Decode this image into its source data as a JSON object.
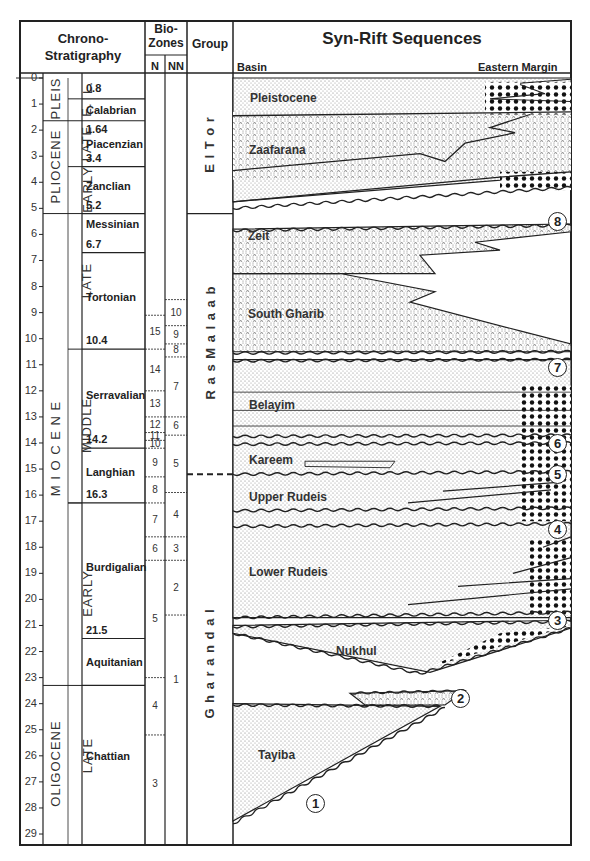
{
  "header": {
    "chrono_title_line1": "Chrono-",
    "chrono_title_line2": "Stratigraphy",
    "biozones_line1": "Bio-",
    "biozones_line2": "Zones",
    "biozone_n": "N",
    "biozone_nn": "NN",
    "group": "Group",
    "sequences_title": "Syn-Rift Sequences",
    "basin": "Basin",
    "eastern_margin": "Eastern Margin"
  },
  "axis": {
    "unit": "Ma",
    "min": 0,
    "max": 29,
    "ticks": [
      "0",
      "1",
      "2",
      "3",
      "4",
      "5",
      "6",
      "7",
      "8",
      "9",
      "10",
      "11",
      "12",
      "13",
      "14",
      "15",
      "16",
      "17",
      "18",
      "19",
      "20",
      "21",
      "22",
      "23",
      "24",
      "25",
      "26",
      "27",
      "28",
      "29"
    ]
  },
  "epochs": [
    {
      "label": "PLEIS",
      "top": 0,
      "base": 1.64
    },
    {
      "label": "PLIOCENE",
      "top": 1.64,
      "base": 5.2
    },
    {
      "label": "M I O C E N E",
      "top": 5.2,
      "base": 23.3
    },
    {
      "label": "OLIGOCENE",
      "top": 23.3,
      "base": 29
    }
  ],
  "subepochs": [
    {
      "label": "L.",
      "top": 0,
      "base": 0.8
    },
    {
      "label": "E.",
      "top": 0.8,
      "base": 1.64
    },
    {
      "label": "LATE",
      "top": 1.64,
      "base": 3.4
    },
    {
      "label": "EARLY",
      "top": 3.4,
      "base": 5.2
    },
    {
      "label": "LATE",
      "top": 5.2,
      "base": 10.4
    },
    {
      "label": "MIDDLE",
      "top": 10.4,
      "base": 16.3
    },
    {
      "label": "EARLY",
      "top": 16.3,
      "base": 23.3
    },
    {
      "label": "LATE",
      "top": 23.3,
      "base": 29
    }
  ],
  "stages": [
    {
      "name": "",
      "age_label": "0.8",
      "top": 0,
      "base": 0.8
    },
    {
      "name": "Calabrian",
      "age_label": "",
      "top": 0.8,
      "base": 1.64
    },
    {
      "name": "Piacenzian",
      "age_label_top": "1.64",
      "age_label": "3.4",
      "top": 1.64,
      "base": 3.4
    },
    {
      "name": "Zanclian",
      "age_label": "5.2",
      "top": 3.4,
      "base": 5.2
    },
    {
      "name": "Messinian",
      "age_label": "6.7",
      "top": 5.2,
      "base": 6.7
    },
    {
      "name": "Tortonian",
      "age_label": "10.4",
      "top": 6.7,
      "base": 10.4
    },
    {
      "name": "Serravalian",
      "age_label": "14.2",
      "top": 10.4,
      "base": 14.2
    },
    {
      "name": "Langhian",
      "age_label": "16.3",
      "top": 14.2,
      "base": 16.3
    },
    {
      "name": "Burdigalian",
      "age_label": "21.5",
      "top": 16.3,
      "base": 21.5
    },
    {
      "name": "Aquitanian",
      "age_label": "",
      "top": 21.5,
      "base": 23.3
    },
    {
      "name": "Chattian",
      "age_label": "",
      "top": 23.3,
      "base": 29
    }
  ],
  "n_zones": [
    {
      "label": "15",
      "top": 9.1,
      "base": 10.4
    },
    {
      "label": "14",
      "top": 10.4,
      "base": 12.0
    },
    {
      "label": "13",
      "top": 12.0,
      "base": 13.0
    },
    {
      "label": "12",
      "top": 13.0,
      "base": 13.6
    },
    {
      "label": "11",
      "top": 13.6,
      "base": 13.9
    },
    {
      "label": "10",
      "top": 13.9,
      "base": 14.2
    },
    {
      "label": "9",
      "top": 14.2,
      "base": 15.3
    },
    {
      "label": "8",
      "top": 15.3,
      "base": 16.3
    },
    {
      "label": "7",
      "top": 16.3,
      "base": 17.6
    },
    {
      "label": "6",
      "top": 17.6,
      "base": 18.5
    },
    {
      "label": "5",
      "top": 18.5,
      "base": 23.0
    },
    {
      "label": "4",
      "top": 23.0,
      "base": 25.2
    },
    {
      "label": "3",
      "top": 25.2,
      "base": 29
    }
  ],
  "nn_zones": [
    {
      "label": "10",
      "top": 8.5,
      "base": 9.5
    },
    {
      "label": "9",
      "top": 9.5,
      "base": 10.2
    },
    {
      "label": "8",
      "top": 10.2,
      "base": 10.7
    },
    {
      "label": "7",
      "top": 10.7,
      "base": 13.0
    },
    {
      "label": "6",
      "top": 13.0,
      "base": 13.7
    },
    {
      "label": "5",
      "top": 13.7,
      "base": 15.9
    },
    {
      "label": "4",
      "top": 15.9,
      "base": 17.6
    },
    {
      "label": "3",
      "top": 17.6,
      "base": 18.5
    },
    {
      "label": "2",
      "top": 18.5,
      "base": 20.6
    },
    {
      "label": "1",
      "top": 20.6,
      "base": 25.6
    }
  ],
  "groups": [
    {
      "label": "E l   T o r",
      "top": 0,
      "base": 5.2
    },
    {
      "label": "R a s     M a l a a b",
      "top": 5.2,
      "base": 15.2
    },
    {
      "label": "G h a r a n d a l",
      "top": 15.2,
      "base": 29
    }
  ],
  "formations": [
    {
      "name": "Pleistocene",
      "age": 0.8
    },
    {
      "name": "Zaafarana",
      "age": 2.8
    },
    {
      "name": "Zeit",
      "age": 6.1
    },
    {
      "name": "South Gharib",
      "age": 9.1
    },
    {
      "name": "Belayim",
      "age": 12.6
    },
    {
      "name": "Kareem",
      "age": 14.7
    },
    {
      "name": "Upper Rudeis",
      "age": 16.1
    },
    {
      "name": "Lower Rudeis",
      "age": 19.0
    },
    {
      "name": "Nukhul",
      "age": 22.0
    },
    {
      "name": "Tayiba",
      "age": 26.0
    }
  ],
  "sequences": [
    {
      "number": "1",
      "age": 27.8
    },
    {
      "number": "2",
      "age": 23.8
    },
    {
      "number": "3",
      "age": 20.8
    },
    {
      "number": "4",
      "age": 17.3
    },
    {
      "number": "5",
      "age": 15.2
    },
    {
      "number": "6",
      "age": 14.0
    },
    {
      "number": "7",
      "age": 11.1
    },
    {
      "number": "8",
      "age": 5.5
    }
  ]
}
